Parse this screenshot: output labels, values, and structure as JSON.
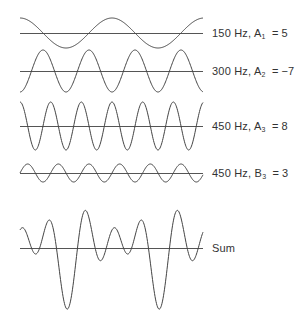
{
  "figure": {
    "background": "#ffffff",
    "line_color": "#444444",
    "x_start": 20,
    "x_end": 203,
    "pixels_per_period_fundamental": 92,
    "pixels_per_unit_amplitude": 3
  },
  "components": [
    {
      "id": "wave-150hz-a1",
      "frequency_label": "150 Hz,",
      "coef_letter": "A",
      "coef_index": "1",
      "equals": "=",
      "coef_value": "5",
      "harmonic": 1,
      "type": "cos",
      "amplitude": 5,
      "baseline_y": 33
    },
    {
      "id": "wave-300hz-a2",
      "frequency_label": "300 Hz,",
      "coef_letter": "A",
      "coef_index": "2",
      "equals": "=",
      "coef_value": "−7",
      "harmonic": 2,
      "type": "cos",
      "amplitude": -7,
      "baseline_y": 71
    },
    {
      "id": "wave-450hz-a3",
      "frequency_label": "450 Hz,",
      "coef_letter": "A",
      "coef_index": "3",
      "equals": "=",
      "coef_value": "8",
      "harmonic": 3,
      "type": "cos",
      "amplitude": 8,
      "baseline_y": 126
    },
    {
      "id": "wave-450hz-b3",
      "frequency_label": "450 Hz,",
      "coef_letter": "B",
      "coef_index": "3",
      "equals": "=",
      "coef_value": "3",
      "harmonic": 3,
      "type": "sin",
      "amplitude": 3,
      "baseline_y": 173
    }
  ],
  "sum": {
    "label": "Sum",
    "baseline_y": 248
  }
}
